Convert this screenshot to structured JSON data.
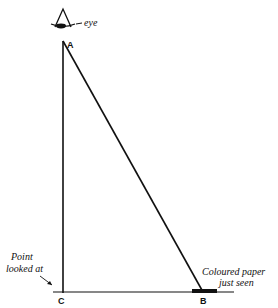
{
  "diagram": {
    "eye_label": "eye",
    "points": {
      "A": "A",
      "B": "B",
      "C": "C"
    },
    "annotations": {
      "point_looked_at_line1": "Point",
      "point_looked_at_line2": "looked at",
      "coloured_paper_line1": "Coloured paper",
      "coloured_paper_line2": "just seen"
    },
    "colors": {
      "ink": "#111111",
      "background": "#ffffff"
    }
  }
}
